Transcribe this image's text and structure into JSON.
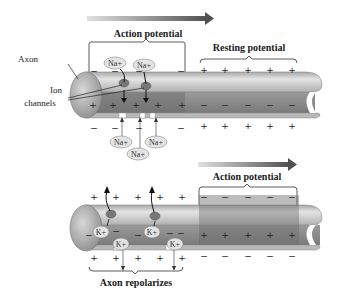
{
  "top_panel": {
    "arrow_label": "Action potential",
    "resting_label": "Resting potential",
    "axon_label": "Axon",
    "ion_channels_label_line1": "Ion",
    "ion_channels_label_line2": "channels",
    "ion_top": [
      "Na+",
      "Na+"
    ],
    "ion_bottom": [
      "Na+",
      "Na+",
      "Na+"
    ],
    "outside_signs_ap": [
      "−",
      "−",
      "−",
      "−"
    ],
    "inside_signs_ap": [
      "+",
      "+",
      "+",
      "+",
      "+"
    ],
    "bottom_signs_ap": [
      "−",
      "−",
      "−",
      "−"
    ],
    "outside_signs_rest": [
      "+",
      "+",
      "+",
      "+",
      "+"
    ],
    "inside_signs_rest": [
      "−",
      "−",
      "−",
      "−",
      "−"
    ],
    "bottom_signs_rest": [
      "+",
      "+",
      "+",
      "+",
      "+"
    ]
  },
  "bottom_panel": {
    "arrow_label": "Action potential",
    "repolarize_label": "Axon repolarizes",
    "ion_inside": [
      "K+",
      "K+"
    ],
    "ion_channel": [
      "K+",
      "K+"
    ],
    "outside_signs_repol": [
      "+",
      "+",
      "+",
      "+",
      "+",
      "+"
    ],
    "bottom_signs_repol": [
      "+",
      "+",
      "+",
      "+",
      "+",
      "+"
    ],
    "outside_signs_ap": [
      "−",
      "−",
      "−",
      "−",
      "−"
    ],
    "inside_signs_ap": [
      "+",
      "+",
      "+",
      "+",
      "+"
    ],
    "bottom_signs_ap": [
      "−",
      "−",
      "−",
      "−",
      "−"
    ]
  },
  "colors": {
    "arrow_gradient_start": "#d8d8d8",
    "arrow_gradient_end": "#555555",
    "axon_light": "#d4d4d4",
    "axon_dark": "#8c8c8c",
    "ap_region": "#777777"
  }
}
